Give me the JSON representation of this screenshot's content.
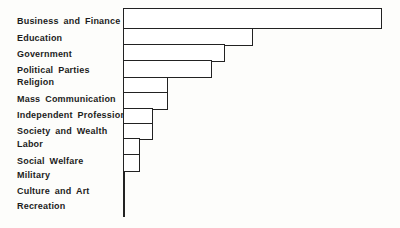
{
  "chart_data": {
    "type": "bar",
    "orientation": "horizontal",
    "title": "",
    "xlabel": "",
    "ylabel": "",
    "categories": [
      "Business and Finance",
      "Education",
      "Government",
      "Political Parties",
      "Religion",
      "Mass Communication",
      "Independent Professions",
      "Society and Wealth",
      "Labor",
      "Social Welfare",
      "Military",
      "Culture and Art",
      "Recreation"
    ],
    "values": [
      258,
      129,
      101,
      88,
      44,
      44,
      29,
      29,
      16,
      16,
      0,
      0,
      0
    ],
    "values_unit": "bar length in screen px; chart has no numeric axis, tick labels, gridlines or legend",
    "values_pct_of_max": [
      100,
      50,
      39,
      34,
      17,
      17,
      11,
      11,
      6,
      6,
      0,
      0,
      0
    ],
    "axis_style": {
      "numeric_labels": false,
      "gridlines": false,
      "legend": false,
      "bar_fill": "#ffffff",
      "bar_stroke": "#222222"
    }
  },
  "colors": {
    "background": "#fdfdfb",
    "ink": "#1c1c1c"
  }
}
